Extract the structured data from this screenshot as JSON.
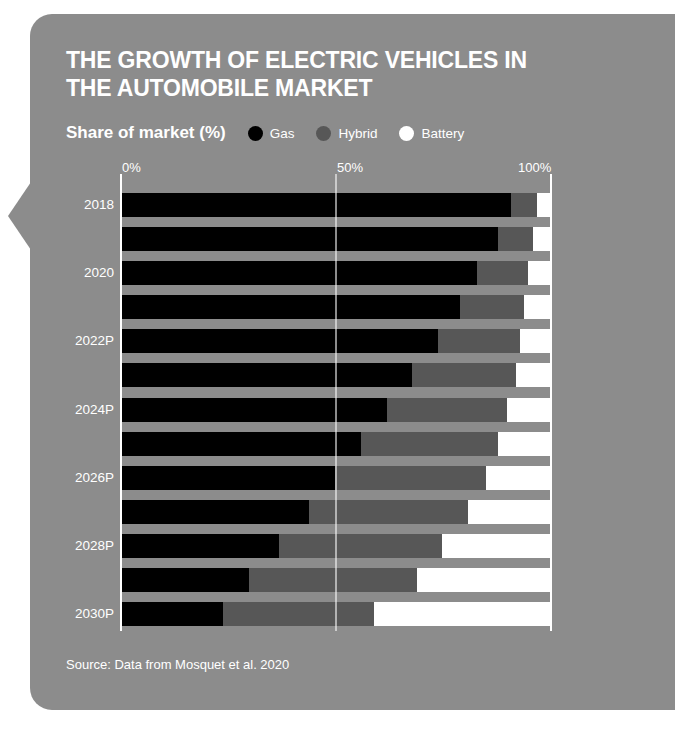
{
  "card": {
    "background": "#8c8c8c"
  },
  "header": {
    "title": "THE GROWTH OF ELECTRIC VEHICLES IN THE AUTOMOBILE MARKET",
    "subtitle": "Share of market (%)"
  },
  "legend": [
    {
      "label": "Gas",
      "color": "#000000"
    },
    {
      "label": "Hybrid",
      "color": "#575757"
    },
    {
      "label": "Battery",
      "color": "#ffffff"
    }
  ],
  "source": "Source: Data from Mosquet et al. 2020",
  "axis": {
    "ticks": [
      "0%",
      "50%",
      "100%"
    ],
    "tick_values": [
      0,
      50,
      100
    ]
  },
  "y_labels": [
    "2018",
    "",
    "2020",
    "",
    "2022P",
    "",
    "2024P",
    "",
    "2026P",
    "",
    "2028P",
    "",
    "2030P"
  ],
  "chart_data": {
    "type": "bar",
    "orientation": "horizontal",
    "stacked": true,
    "title": "THE GROWTH OF ELECTRIC VEHICLES IN THE AUTOMOBILE MARKET",
    "subtitle": "Share of market (%)",
    "xlabel": "",
    "ylabel": "",
    "xlim": [
      0,
      100
    ],
    "grid": false,
    "legend_position": "top",
    "categories": [
      "2018",
      "2019",
      "2020",
      "2021",
      "2022P",
      "2023P",
      "2024P",
      "2025P",
      "2026P",
      "2027P",
      "2028P",
      "2029P",
      "2030P"
    ],
    "series": [
      {
        "name": "Gas",
        "color": "#000000",
        "values": [
          91,
          88,
          83,
          79,
          74,
          68,
          62,
          56,
          50,
          44,
          37,
          30,
          24
        ]
      },
      {
        "name": "Hybrid",
        "color": "#575757",
        "values": [
          6,
          8,
          12,
          15,
          19,
          24,
          28,
          32,
          35,
          37,
          38,
          39,
          35
        ]
      },
      {
        "name": "Battery",
        "color": "#ffffff",
        "values": [
          3,
          4,
          5,
          6,
          7,
          8,
          10,
          12,
          15,
          19,
          25,
          31,
          41
        ]
      }
    ],
    "source": "Source: Data from Mosquet et al. 2020"
  }
}
